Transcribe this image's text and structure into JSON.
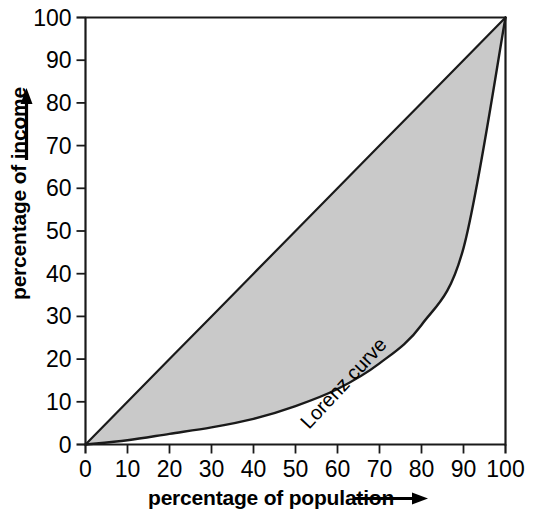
{
  "chart_data": {
    "type": "area",
    "title": "",
    "subtitle": "",
    "xlabel": "percentage of population",
    "ylabel": "percentage of income",
    "xlim": [
      0,
      100
    ],
    "ylim": [
      0,
      100
    ],
    "grid": false,
    "legend_position": "inline-annotation",
    "x_ticks": [
      "0",
      "10",
      "20",
      "30",
      "40",
      "50",
      "60",
      "70",
      "80",
      "90",
      "100"
    ],
    "y_ticks": [
      "0",
      "10",
      "20",
      "30",
      "40",
      "50",
      "60",
      "70",
      "80",
      "90",
      "100"
    ],
    "x_tick_values": [
      0,
      10,
      20,
      30,
      40,
      50,
      60,
      70,
      80,
      90,
      100
    ],
    "y_tick_values": [
      0,
      10,
      20,
      30,
      40,
      50,
      60,
      70,
      80,
      90,
      100
    ],
    "x": [
      0,
      10,
      20,
      30,
      40,
      50,
      60,
      70,
      80,
      90,
      100
    ],
    "series": [
      {
        "name": "line of equality",
        "values": [
          0,
          10,
          20,
          30,
          40,
          50,
          60,
          70,
          80,
          90,
          100
        ],
        "style": "solid-line",
        "color": "#1a1a1a"
      },
      {
        "name": "Lorenz curve",
        "values": [
          0,
          1,
          2.5,
          4,
          6,
          9,
          13,
          19,
          28,
          46,
          100
        ],
        "style": "solid-curve",
        "color": "#1a1a1a"
      }
    ],
    "shaded_region": {
      "name": "inequality gap",
      "between": [
        "line of equality",
        "Lorenz curve"
      ],
      "fill_color": "#c9c9c9"
    },
    "annotations": [
      {
        "text": "Lorenz curve",
        "x": 83,
        "y": 24,
        "rotation": -47
      }
    ],
    "axis_arrows": {
      "x_axis_arrow": true,
      "y_axis_arrow": true
    },
    "colors": {
      "background": "#ffffff",
      "axis": "#1a1a1a",
      "text": "#000000",
      "fill": "#c9c9c9"
    }
  }
}
